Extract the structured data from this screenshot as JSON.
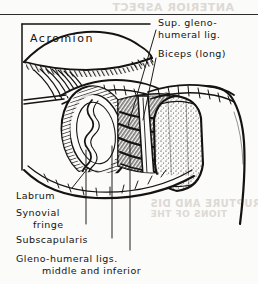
{
  "figure": {
    "kind": "anatomical-line-drawing",
    "ink_color": "#15120f",
    "paper_color": "#fbfbf9"
  },
  "page": {
    "rule": "horizontal-rule-top",
    "showthrough": {
      "top": "ANTERIOR ASPECT",
      "bottom_line1": "RUPTURE AND DIS",
      "bottom_line2": "TIONS OF THE"
    }
  },
  "labels": {
    "acromion": "Acromion",
    "sup_glenohumeral_lig_line1": "Sup. gleno-",
    "sup_glenohumeral_lig_line2": "humeral lig.",
    "biceps": "Biceps (long)",
    "labrum": "Labrum",
    "synovial_fringe_line1": "Synovial",
    "synovial_fringe_line2": "fringe",
    "subscapularis": "Subscapularis",
    "glenohumeral_ligs_line1": "Gleno-humeral ligs.",
    "glenohumeral_ligs_line2": "middle and inferior"
  },
  "leaders": {
    "count": 6,
    "description": "Thin ruled pointer lines from each caption into the dissection"
  }
}
